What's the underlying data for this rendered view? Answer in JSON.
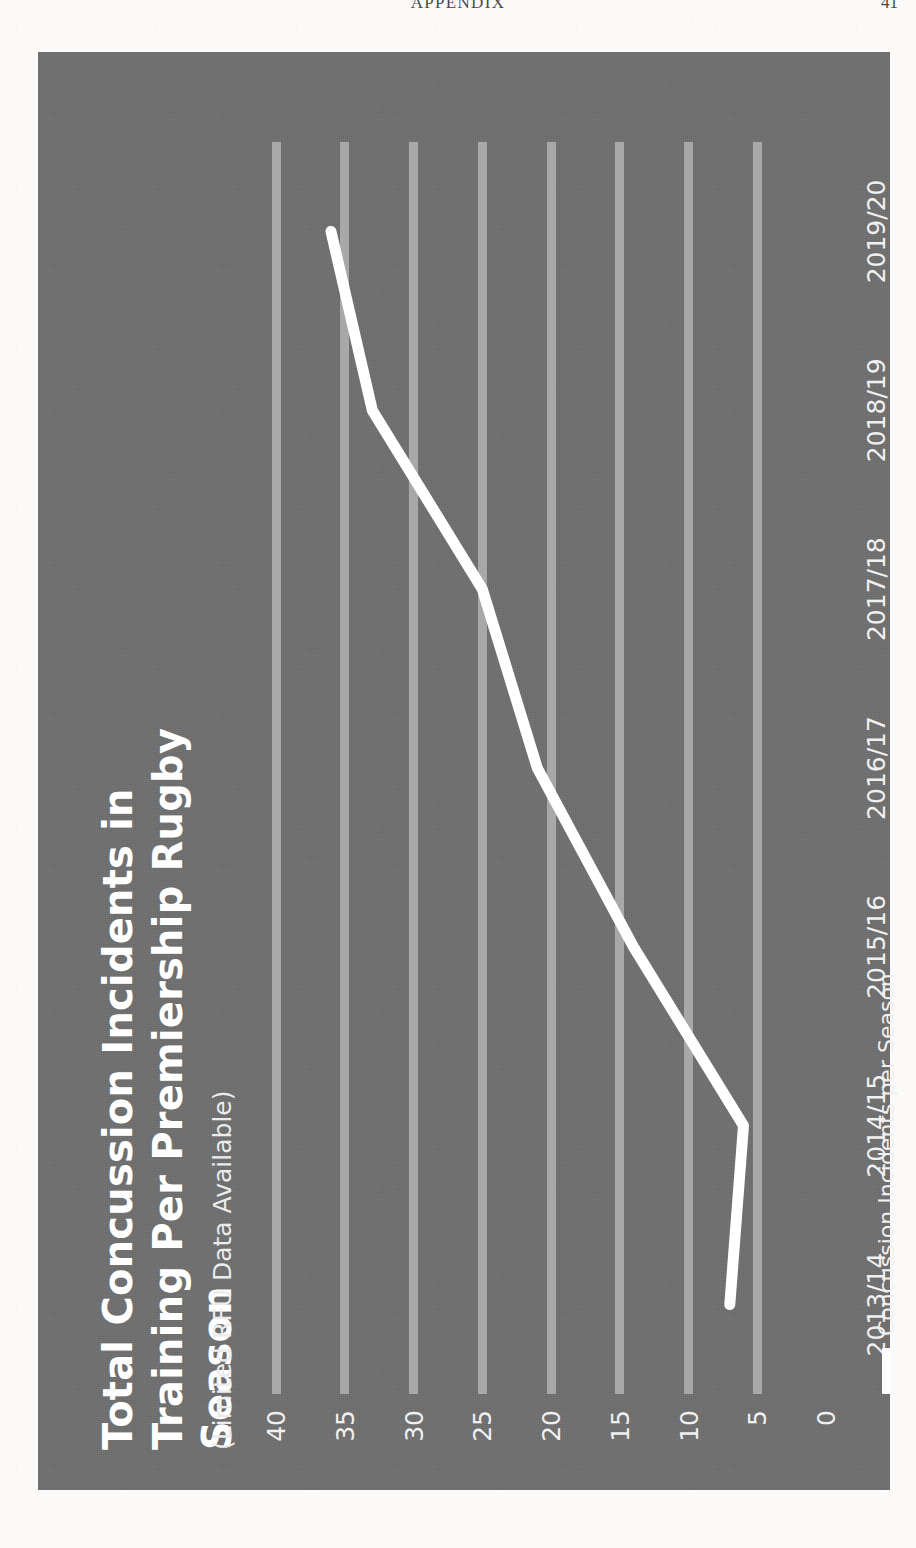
{
  "page": {
    "running_head": "APPENDIX",
    "page_number": "41"
  },
  "figure": {
    "title": "Total Concussion Incidents in Training Per Premiership Rugby Season",
    "subtitle": "(Limited RFU Data Available)",
    "panel_color": "#6f6f6f",
    "series_color": "#ffffff",
    "gridline_color": "#a8a8a8",
    "legend": {
      "label": "Concussion Incidents per Season"
    }
  },
  "chart_data": {
    "type": "line",
    "title": "Total Concussion Incidents in Training Per Premiership Rugby Season",
    "subtitle": "(Limited RFU Data Available)",
    "xlabel": "",
    "ylabel": "",
    "categories": [
      "2013/14",
      "2014/15",
      "2015/16",
      "2016/17",
      "2017/18",
      "2018/19",
      "2019/20"
    ],
    "series": [
      {
        "name": "Concussion Incidents per Season",
        "values": [
          7,
          6,
          14,
          21,
          25,
          33,
          36
        ],
        "color": "#ffffff"
      }
    ],
    "ylim": [
      0,
      40
    ],
    "yticks": [
      0,
      5,
      10,
      15,
      20,
      25,
      30,
      35,
      40
    ],
    "ytick_labels": [
      "0",
      "5",
      "10",
      "15",
      "20",
      "25",
      "30",
      "35",
      "40"
    ],
    "grid": true,
    "grid_axis": "y",
    "legend_position": "bottom-left",
    "orientation_on_page": "rotated-90-ccw"
  }
}
